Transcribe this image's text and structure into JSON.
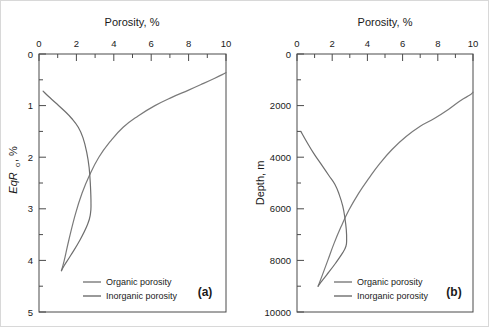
{
  "figure": {
    "panels": [
      {
        "id": "a",
        "label": "(a)",
        "x_axis_title": "Porosity, %",
        "y_axis_title_main": "EqR",
        "y_axis_title_sub": "o",
        "y_axis_title_tail": ", %",
        "x_ticks": [
          "0",
          "2",
          "4",
          "6",
          "8",
          "10"
        ],
        "y_ticks": [
          "0",
          "1",
          "2",
          "3",
          "4",
          "5"
        ],
        "legend": [
          {
            "label": "Organic porosity",
            "color": "#7a7a7a"
          },
          {
            "label": "Inorganic porosity",
            "color": "#6e6e6e"
          }
        ]
      },
      {
        "id": "b",
        "label": "(b)",
        "x_axis_title": "Porosity, %",
        "y_axis_title": "Depth, m",
        "x_ticks": [
          "0",
          "2",
          "4",
          "6",
          "8",
          "10"
        ],
        "y_ticks": [
          "0",
          "2000",
          "4000",
          "6000",
          "8000",
          "10000"
        ],
        "legend": [
          {
            "label": "Organic porosity",
            "color": "#7a7a7a"
          },
          {
            "label": "Inorganic porosity",
            "color": "#6e6e6e"
          }
        ]
      }
    ]
  },
  "chart_data": [
    {
      "type": "line",
      "panel": "a",
      "title": "Porosity, %",
      "xlabel": "Porosity, %",
      "ylabel": "EqRo, %",
      "xlim": [
        0,
        10
      ],
      "ylim": [
        0,
        5
      ],
      "y_inverted": true,
      "x_axis_position": "top",
      "grid": false,
      "legend_position": "bottom-left",
      "xticks": [
        0,
        2,
        4,
        6,
        8,
        10
      ],
      "xminorticks": [
        1,
        3,
        5,
        7,
        9
      ],
      "yticks": [
        0,
        1,
        2,
        3,
        4,
        5
      ],
      "yminorticks": [
        0.5,
        1.5,
        2.5,
        3.5,
        4.5
      ],
      "series": [
        {
          "name": "Organic porosity",
          "color": "#7a7a7a",
          "x": [
            1.2,
            1.35,
            1.6,
            1.95,
            2.3,
            2.7,
            3.2,
            3.8,
            4.5,
            5.3,
            6.2,
            7.1,
            8.0,
            8.8,
            9.4,
            9.8,
            10.0
          ],
          "y": [
            4.2,
            4.0,
            3.6,
            3.1,
            2.7,
            2.35,
            2.0,
            1.7,
            1.42,
            1.2,
            1.0,
            0.84,
            0.7,
            0.57,
            0.47,
            0.4,
            0.36
          ]
        },
        {
          "name": "Inorganic porosity",
          "color": "#6e6e6e",
          "x": [
            0.22,
            0.5,
            0.9,
            1.35,
            1.75,
            2.1,
            2.35,
            2.55,
            2.68,
            2.75,
            2.78,
            2.75,
            2.6,
            2.2,
            1.7,
            1.35,
            1.2
          ],
          "y": [
            0.72,
            0.82,
            0.95,
            1.1,
            1.25,
            1.42,
            1.62,
            1.9,
            2.2,
            2.55,
            2.9,
            3.1,
            3.3,
            3.6,
            3.9,
            4.1,
            4.2
          ]
        }
      ]
    },
    {
      "type": "line",
      "panel": "b",
      "title": "Porosity, %",
      "xlabel": "Porosity, %",
      "ylabel": "Depth, m",
      "xlim": [
        0,
        10
      ],
      "ylim": [
        0,
        10000
      ],
      "y_inverted": true,
      "x_axis_position": "top",
      "grid": false,
      "legend_position": "bottom-left",
      "xticks": [
        0,
        2,
        4,
        6,
        8,
        10
      ],
      "xminorticks": [
        1,
        3,
        5,
        7,
        9
      ],
      "yticks": [
        0,
        2000,
        4000,
        6000,
        8000,
        10000
      ],
      "yminorticks": [
        1000,
        3000,
        5000,
        7000,
        9000
      ],
      "series": [
        {
          "name": "Organic porosity",
          "color": "#7a7a7a",
          "x": [
            1.2,
            1.45,
            1.75,
            2.1,
            2.5,
            2.95,
            3.5,
            4.1,
            4.7,
            5.4,
            6.2,
            7.0,
            7.8,
            8.6,
            9.3,
            9.8,
            10.0
          ],
          "y": [
            9000,
            8550,
            8000,
            7350,
            6700,
            6050,
            5400,
            4800,
            4250,
            3700,
            3200,
            2800,
            2500,
            2150,
            1800,
            1600,
            1480
          ]
        },
        {
          "name": "Inorganic porosity",
          "color": "#6e6e6e",
          "x": [
            0.22,
            0.55,
            0.95,
            1.4,
            1.8,
            2.15,
            2.4,
            2.6,
            2.72,
            2.8,
            2.82,
            2.78,
            2.6,
            2.2,
            1.7,
            1.35,
            1.2
          ],
          "y": [
            3000,
            3400,
            3850,
            4300,
            4700,
            5050,
            5450,
            5900,
            6350,
            6800,
            7200,
            7450,
            7700,
            8100,
            8550,
            8850,
            9000
          ]
        }
      ]
    }
  ]
}
